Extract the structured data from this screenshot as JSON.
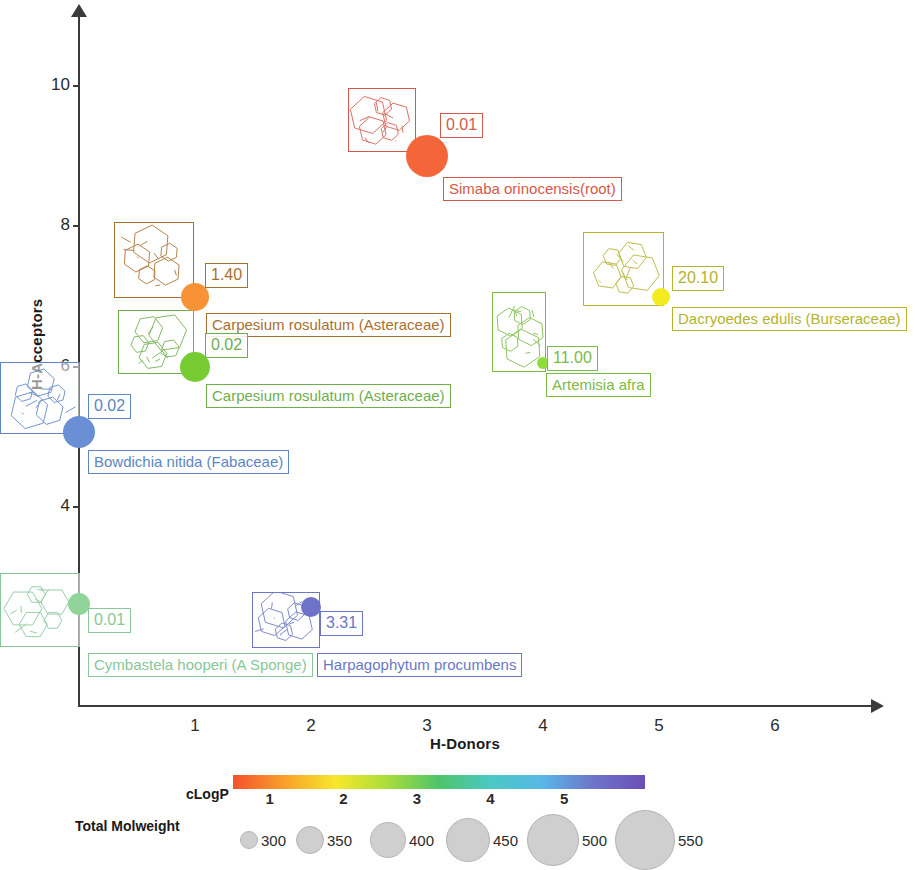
{
  "chart_data": {
    "type": "scatter",
    "title": "",
    "xlabel": "H-Donors",
    "ylabel": "H-Acceptors",
    "xlim": [
      0,
      6.6
    ],
    "ylim": [
      0,
      11
    ],
    "xticks": [
      1,
      2,
      3,
      4,
      5,
      6
    ],
    "yticks": [
      4,
      6,
      8,
      10
    ],
    "grid": false,
    "size_encodes": "Total Molweight",
    "color_encodes": "cLogP",
    "points": [
      {
        "name": "Simaba orinocensis(root)",
        "x": 3.0,
        "y": 9.0,
        "value_label": "0.01",
        "color": "#f4663a",
        "radius_px": 21,
        "label_color": "#d4594a"
      },
      {
        "name": "Carpesium rosulatum (Asteraceae)",
        "x": 1.0,
        "y": 7.0,
        "value_label": "1.40",
        "color": "#f79336",
        "radius_px": 14,
        "label_color": "#a8702f"
      },
      {
        "name": "Carpesium rosulatum (Asteraceae)",
        "x": 1.0,
        "y": 6.0,
        "value_label": "0.02",
        "color": "#77cc33",
        "radius_px": 15,
        "label_color": "#6fae4c"
      },
      {
        "name": "Dacryoedes edulis (Burseraceae)",
        "x": 5.02,
        "y": 7.0,
        "value_label": "20.10",
        "color": "#f2ec1f",
        "radius_px": 9,
        "label_color": "#b5b32c"
      },
      {
        "name": "Artemisia afra",
        "x": 4.0,
        "y": 6.05,
        "value_label": "11.00",
        "color": "#8ddc3a",
        "radius_px": 6,
        "label_color": "#7bbb45"
      },
      {
        "name": "Bowdichia nitida (Fabaceae)",
        "x": 0.0,
        "y": 5.07,
        "value_label": "0.02",
        "color": "#6b8fd4",
        "radius_px": 16,
        "label_color": "#5c86c4"
      },
      {
        "name": "Cymbastela hooperi (A Sponge)",
        "x": 0.0,
        "y": 2.62,
        "value_label": "0.01",
        "color": "#91d49a",
        "radius_px": 11,
        "label_color": "#87c79a"
      },
      {
        "name": "Harpagophytum procumbens",
        "x": 2.0,
        "y": 2.58,
        "value_label": "3.31",
        "color": "#6f72c9",
        "radius_px": 10,
        "label_color": "#6a78c4"
      }
    ]
  },
  "legend": {
    "colorbar": {
      "label": "cLogP",
      "ticks": [
        "1",
        "2",
        "3",
        "4",
        "5"
      ],
      "gradient_stops": [
        "#f4512c",
        "#f9a02a",
        "#f7e82b",
        "#a8dd3a",
        "#4fc46a",
        "#49c9c4",
        "#59b7e8",
        "#6f74c9",
        "#6a4fb6"
      ]
    },
    "size": {
      "label": "Total Molweight",
      "items": [
        {
          "value": "300",
          "diameter_px": 16
        },
        {
          "value": "350",
          "diameter_px": 26
        },
        {
          "value": "400",
          "diameter_px": 34
        },
        {
          "value": "450",
          "diameter_px": 42
        },
        {
          "value": "500",
          "diameter_px": 50
        },
        {
          "value": "550",
          "diameter_px": 58
        }
      ]
    }
  }
}
